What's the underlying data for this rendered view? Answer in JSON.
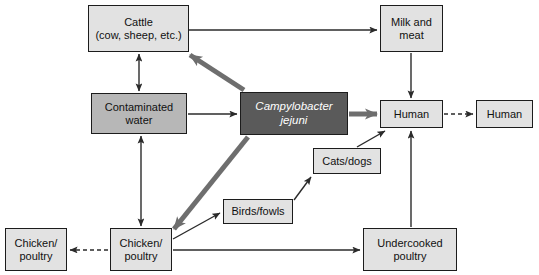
{
  "figure": {
    "type": "flow-diagram",
    "width": 539,
    "height": 275,
    "background": "#ffffff"
  },
  "colors": {
    "box_light_gray": "#e2e2e2",
    "box_mid_gray": "#b7b7b7",
    "box_dark_gray": "#5a5a5a",
    "box_border": "#1c1c1c",
    "thin_arrow": "#2b2b2b",
    "thick_arrow": "#6e6e6e",
    "text_dark": "#111111",
    "text_light": "#ffffff"
  },
  "nodes": {
    "cattle": {
      "label_line1": "Cattle",
      "label_line2": "(cow, sheep, etc.)",
      "fill": "#e2e2e2",
      "x": 88,
      "y": 5,
      "w": 101,
      "h": 47
    },
    "milk_and_meat": {
      "label_line1": "Milk and",
      "label_line2": "meat",
      "fill": "#e2e2e2",
      "x": 380,
      "y": 5,
      "w": 63,
      "h": 47
    },
    "contaminated_water": {
      "label_line1": "Contaminated",
      "label_line2": "water",
      "fill": "#b7b7b7",
      "x": 91,
      "y": 93,
      "w": 96,
      "h": 41
    },
    "campylobacter": {
      "label_line1": "Campylobacter",
      "label_line2": "jejuni",
      "fill": "#5a5a5a",
      "x": 240,
      "y": 92,
      "w": 108,
      "h": 43
    },
    "human_primary": {
      "label_line1": "Human",
      "label_line2": "",
      "fill": "#e2e2e2",
      "x": 380,
      "y": 100,
      "w": 63,
      "h": 28
    },
    "human_secondary": {
      "label_line1": "Human",
      "label_line2": "",
      "fill": "#e2e2e2",
      "x": 476,
      "y": 100,
      "w": 57,
      "h": 28
    },
    "cats_dogs": {
      "label_line1": "Cats/dogs",
      "label_line2": "",
      "fill": "#e2e2e2",
      "x": 313,
      "y": 148,
      "w": 68,
      "h": 26
    },
    "birds_fowls": {
      "label_line1": "Birds/fowls",
      "label_line2": "",
      "fill": "#e2e2e2",
      "x": 223,
      "y": 199,
      "w": 70,
      "h": 25
    },
    "chicken_poultry_center": {
      "label_line1": "Chicken/",
      "label_line2": "poultry",
      "fill": "#e2e2e2",
      "x": 110,
      "y": 228,
      "w": 62,
      "h": 43
    },
    "chicken_poultry_left": {
      "label_line1": "Chicken/",
      "label_line2": "poultry",
      "fill": "#e2e2e2",
      "x": 5,
      "y": 228,
      "w": 62,
      "h": 43
    },
    "undercooked_poultry": {
      "label_line1": "Undercooked",
      "label_line2": "poultry",
      "fill": "#e2e2e2",
      "x": 363,
      "y": 228,
      "w": 94,
      "h": 43
    }
  },
  "edges": [
    {
      "id": "cattle-to-milk",
      "from": "cattle",
      "to": "milk_and_meat",
      "style": "thin-solid",
      "arrows": "single"
    },
    {
      "id": "campylobacter-to-cattle",
      "from": "campylobacter",
      "to": "cattle",
      "style": "thick-solid",
      "arrows": "single"
    },
    {
      "id": "cattle-water",
      "from": "cattle",
      "to": "contaminated_water",
      "style": "thin-solid",
      "arrows": "double"
    },
    {
      "id": "water-to-campylobacter",
      "from": "contaminated_water",
      "to": "campylobacter",
      "style": "thin-solid",
      "arrows": "single"
    },
    {
      "id": "water-chicken",
      "from": "contaminated_water",
      "to": "chicken_poultry_center",
      "style": "thin-solid",
      "arrows": "double"
    },
    {
      "id": "campylobacter-to-human",
      "from": "campylobacter",
      "to": "human_primary",
      "style": "thick-solid",
      "arrows": "single"
    },
    {
      "id": "campylobacter-to-chicken",
      "from": "campylobacter",
      "to": "chicken_poultry_center",
      "style": "thick-solid",
      "arrows": "single"
    },
    {
      "id": "milk-to-human",
      "from": "milk_and_meat",
      "to": "human_primary",
      "style": "thin-solid",
      "arrows": "single"
    },
    {
      "id": "human-to-human",
      "from": "human_primary",
      "to": "human_secondary",
      "style": "thin-dashed",
      "arrows": "single"
    },
    {
      "id": "cats-to-human",
      "from": "cats_dogs",
      "to": "human_primary",
      "style": "thin-solid",
      "arrows": "single"
    },
    {
      "id": "birds-to-cats",
      "from": "birds_fowls",
      "to": "cats_dogs",
      "style": "thin-solid",
      "arrows": "single"
    },
    {
      "id": "chicken-to-birds",
      "from": "chicken_poultry_center",
      "to": "birds_fowls",
      "style": "thin-solid",
      "arrows": "single"
    },
    {
      "id": "chicken-to-undercooked",
      "from": "chicken_poultry_center",
      "to": "undercooked_poultry",
      "style": "thin-solid",
      "arrows": "single"
    },
    {
      "id": "chicken-to-chicken-left",
      "from": "chicken_poultry_center",
      "to": "chicken_poultry_left",
      "style": "thin-dashed",
      "arrows": "single"
    },
    {
      "id": "undercooked-to-human",
      "from": "undercooked_poultry",
      "to": "human_primary",
      "style": "thin-solid",
      "arrows": "single"
    },
    {
      "id": "cats-to-undercooked-line",
      "from": "cats_dogs",
      "to": "undercooked_poultry",
      "style": "thin-solid",
      "arrows": "none"
    }
  ]
}
